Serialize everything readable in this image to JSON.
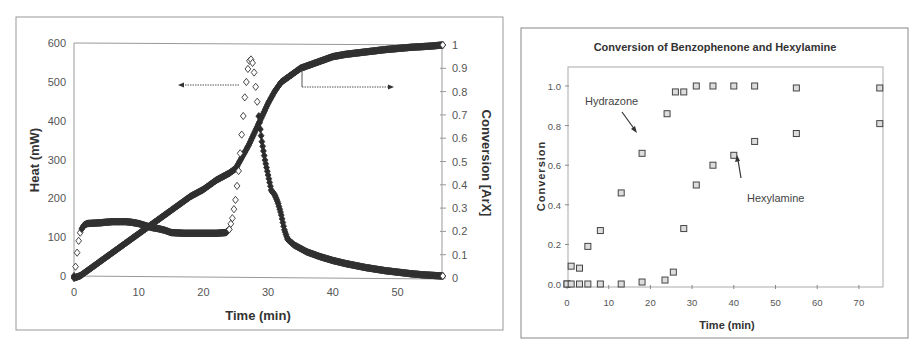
{
  "chart_data": [
    {
      "type": "scatter",
      "title": "",
      "xlabel": "Time (min)",
      "ylabel": "Heat (mW)",
      "y2label": "Conversion [ArX]",
      "xlim": [
        0,
        57
      ],
      "ylim": [
        0,
        600
      ],
      "y2lim": [
        0,
        1
      ],
      "xticks": [
        "0",
        "10",
        "20",
        "30",
        "40",
        "50"
      ],
      "yticks": [
        "0",
        "100",
        "200",
        "300",
        "400",
        "500",
        "600"
      ],
      "y2ticks": [
        "0",
        "0.1",
        "0.2",
        "0.3",
        "0.4",
        "0.5",
        "0.6",
        "0.7",
        "0.8",
        "0.9",
        "1"
      ],
      "grid": false,
      "legend": null,
      "annotations": [
        {
          "type": "arrow-left",
          "points_to": "left axis (Heat)"
        },
        {
          "type": "arrow-right",
          "points_to": "right axis (Conversion)"
        }
      ],
      "series": [
        {
          "name": "Heat",
          "axis": "left",
          "marker": "diamond-open",
          "x": [
            0,
            0.3,
            0.6,
            1,
            1.5,
            2,
            4,
            6,
            8,
            9,
            10,
            11,
            12,
            13,
            14,
            15,
            17,
            20,
            22,
            23.5,
            24,
            24.5,
            25,
            25.5,
            26,
            26.5,
            27,
            27.3,
            27.7,
            28,
            28.5,
            29,
            29.5,
            30,
            30.5,
            31,
            31.5,
            32,
            32.5,
            33,
            34,
            36,
            38,
            40,
            42,
            45,
            48,
            50,
            52,
            54,
            56,
            57
          ],
          "values": [
            0,
            30,
            80,
            115,
            130,
            135,
            137,
            140,
            140,
            138,
            135,
            130,
            125,
            122,
            118,
            112,
            110,
            110,
            110,
            112,
            120,
            150,
            200,
            280,
            380,
            480,
            550,
            560,
            545,
            500,
            420,
            350,
            300,
            260,
            220,
            210,
            190,
            160,
            120,
            95,
            80,
            62,
            50,
            40,
            32,
            22,
            14,
            10,
            6,
            3,
            1,
            0
          ]
        },
        {
          "name": "Conversion [ArX]",
          "axis": "right",
          "marker": "diamond-filled",
          "x": [
            0,
            1,
            2,
            4,
            6,
            8,
            10,
            12,
            14,
            16,
            18,
            20,
            22,
            24,
            25,
            26,
            27,
            28,
            29,
            30,
            31,
            32,
            33,
            34,
            35,
            36,
            38,
            40,
            42,
            45,
            48,
            50,
            52,
            55,
            57
          ],
          "values": [
            0,
            0.01,
            0.03,
            0.07,
            0.11,
            0.15,
            0.19,
            0.23,
            0.27,
            0.31,
            0.35,
            0.38,
            0.42,
            0.45,
            0.47,
            0.52,
            0.57,
            0.63,
            0.69,
            0.75,
            0.8,
            0.84,
            0.86,
            0.88,
            0.9,
            0.91,
            0.93,
            0.95,
            0.96,
            0.97,
            0.98,
            0.985,
            0.99,
            0.995,
            1.0
          ]
        }
      ]
    },
    {
      "type": "scatter",
      "title": "Conversion of Benzophenone and Hexylamine",
      "xlabel": "Time (min)",
      "ylabel": "Conversion",
      "xlim": [
        0,
        75
      ],
      "ylim": [
        0,
        1.1
      ],
      "xticks": [
        "0",
        "10",
        "20",
        "30",
        "40",
        "50",
        "60",
        "70"
      ],
      "yticks": [
        "0.0",
        "0.2",
        "0.4",
        "0.6",
        "0.8",
        "1.0"
      ],
      "grid": false,
      "legend": null,
      "annotations": [
        {
          "text": "Hydrazone",
          "arrow_to": [
            17,
            0.77
          ]
        },
        {
          "text": "Hexylamine",
          "arrow_to": [
            41,
            0.65
          ]
        }
      ],
      "series": [
        {
          "name": "Hydrazone",
          "marker": "square-open",
          "x": [
            0,
            1,
            3,
            5,
            8,
            13,
            18,
            24,
            26,
            28,
            31,
            35,
            40,
            45,
            55,
            75
          ],
          "values": [
            0,
            0.09,
            0.08,
            0.19,
            0.27,
            0.46,
            0.66,
            0.86,
            0.97,
            0.97,
            1.0,
            1.0,
            1.0,
            1.0,
            0.99,
            0.99
          ]
        },
        {
          "name": "Hexylamine",
          "marker": "square-open",
          "x": [
            0,
            1,
            3,
            5,
            8,
            13,
            18,
            23.5,
            25.5,
            28,
            31,
            35,
            40,
            45,
            55,
            75
          ],
          "values": [
            0,
            0,
            0,
            0,
            0,
            0,
            0.01,
            0.02,
            0.06,
            0.28,
            0.5,
            0.6,
            0.65,
            0.72,
            0.76,
            0.81
          ]
        }
      ]
    }
  ],
  "left_chart": {
    "xlabel": "Time (min)",
    "ylabel": "Heat (mW)",
    "y2label": "Conversion [ArX]"
  },
  "right_chart": {
    "title": "Conversion of Benzophenone and Hexylamine",
    "xlabel": "Time (min)",
    "ylabel": "Conversion",
    "annotation_hydrazone": "Hydrazone",
    "annotation_hexylamine": "Hexylamine"
  }
}
